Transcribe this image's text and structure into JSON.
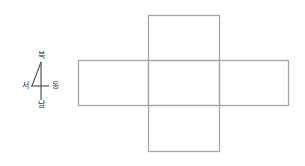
{
  "compass": {
    "north": "북",
    "south": "남",
    "east": "동",
    "west": "서"
  },
  "net": {
    "line_color": "#a6a6a6",
    "faces": [
      {
        "name": "top",
        "x": 148,
        "y": 15,
        "w": 71,
        "h": 45
      },
      {
        "name": "left",
        "x": 78,
        "y": 60,
        "w": 70,
        "h": 45
      },
      {
        "name": "center",
        "x": 148,
        "y": 60,
        "w": 71,
        "h": 45
      },
      {
        "name": "right",
        "x": 219,
        "y": 60,
        "w": 69,
        "h": 45
      },
      {
        "name": "bottom",
        "x": 148,
        "y": 105,
        "w": 71,
        "h": 46
      }
    ]
  }
}
